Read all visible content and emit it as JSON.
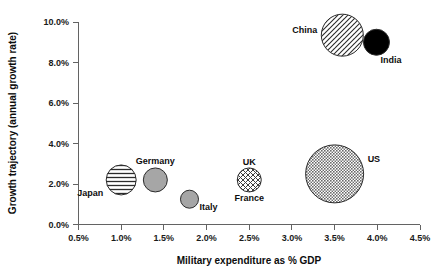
{
  "chart_data": {
    "type": "scatter",
    "title": "",
    "xlabel": "Military expenditure as % GDP",
    "ylabel": "Growth trajectory (annual growth rate)",
    "xlim": [
      0.5,
      4.5
    ],
    "ylim": [
      0.0,
      10.0
    ],
    "grid": false,
    "legend": "none",
    "xticks": [
      "0.5%",
      "1.0%",
      "1.5%",
      "2.0%",
      "2.5%",
      "3.0%",
      "3.5%",
      "4.0%",
      "4.5%"
    ],
    "xtick_values": [
      0.5,
      1.0,
      1.5,
      2.0,
      2.5,
      3.0,
      3.5,
      4.0,
      4.5
    ],
    "yticks": [
      "0.0%",
      "2.0%",
      "4.0%",
      "6.0%",
      "8.0%",
      "10.0%"
    ],
    "ytick_values": [
      0.0,
      2.0,
      4.0,
      6.0,
      8.0,
      10.0
    ],
    "points": [
      {
        "label": "Japan",
        "x": 1.0,
        "y": 2.2,
        "r": 15,
        "fill": "horizontal-lines",
        "label_dx": -18,
        "label_dy": 16,
        "label_anchor": "end"
      },
      {
        "label": "Germany",
        "x": 1.4,
        "y": 2.2,
        "r": 12,
        "fill": "solid-gray",
        "label_dx": 0,
        "label_dy": -16,
        "label_anchor": "middle"
      },
      {
        "label": "Italy",
        "x": 1.8,
        "y": 1.25,
        "r": 9,
        "fill": "solid-gray",
        "label_dx": 10,
        "label_dy": 11,
        "label_anchor": "start"
      },
      {
        "label": "UK",
        "x": 2.5,
        "y": 2.2,
        "r": 12,
        "fill": "cross-hatch",
        "label_dx": 0,
        "label_dy": -15,
        "label_anchor": "middle"
      },
      {
        "label": "France",
        "x": 2.5,
        "y": 2.2,
        "r": 0,
        "fill": "none",
        "label_dx": 0,
        "label_dy": 21,
        "label_anchor": "middle"
      },
      {
        "label": "US",
        "x": 3.5,
        "y": 2.5,
        "r": 29,
        "fill": "fine-checker",
        "label_dx": 33,
        "label_dy": -12,
        "label_anchor": "start"
      },
      {
        "label": "China",
        "x": 3.59,
        "y": 9.35,
        "r": 21,
        "fill": "diagonal-hatch",
        "label_dx": -25,
        "label_dy": -2,
        "label_anchor": "end"
      },
      {
        "label": "India",
        "x": 3.99,
        "y": 9.0,
        "r": 13,
        "fill": "solid-black",
        "label_dx": 4,
        "label_dy": 21,
        "label_anchor": "start"
      }
    ],
    "colors": {
      "axis": "#636363",
      "text": "#0d0d0d",
      "solid_gray": "#a6a6a6",
      "solid_black": "#000000",
      "pattern_stroke": "#2b2b2b",
      "background": "#ffffff"
    }
  }
}
